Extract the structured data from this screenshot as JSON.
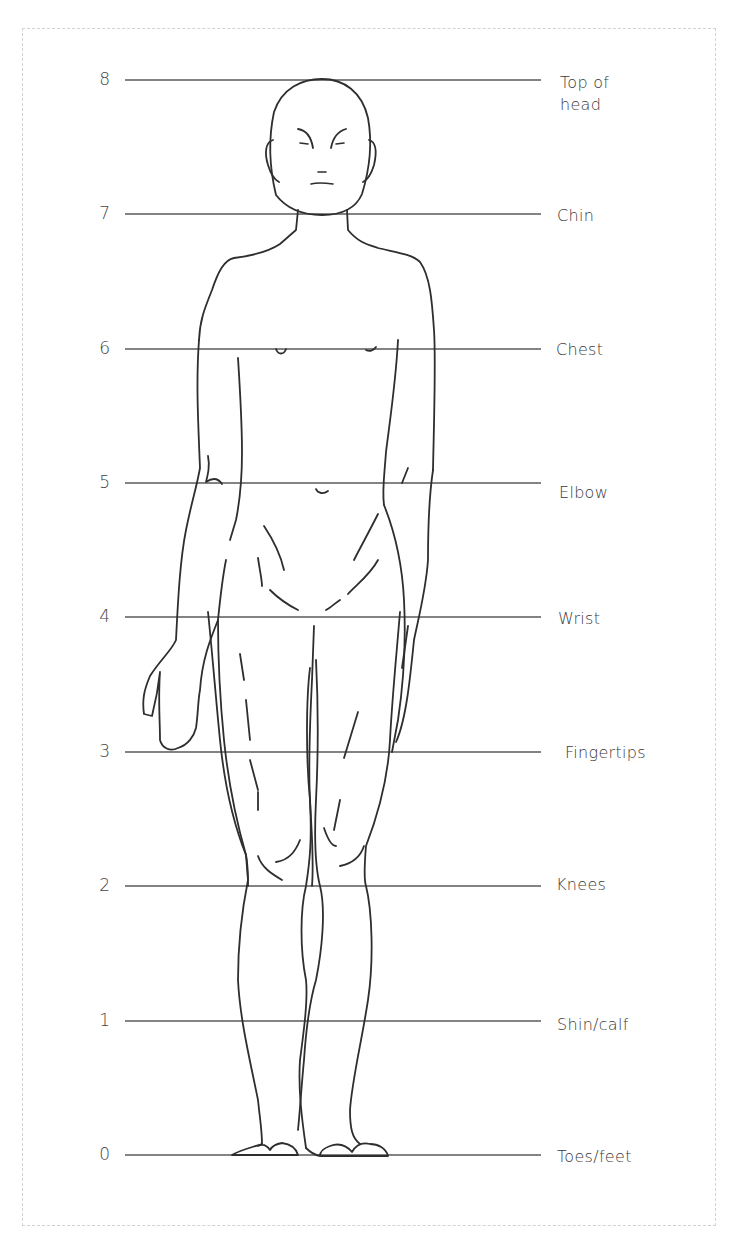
{
  "diagram": {
    "colors": {
      "line": "#555555",
      "text": "#444444",
      "border": "#d2d2d2",
      "background": "#ffffff"
    },
    "levels": [
      {
        "value": "8",
        "label": "Top of\nhead",
        "y": 80
      },
      {
        "value": "7",
        "label": "Chin",
        "y": 214
      },
      {
        "value": "6",
        "label": "Chest",
        "y": 349
      },
      {
        "value": "5",
        "label": "Elbow",
        "y": 483
      },
      {
        "value": "4",
        "label": "Wrist",
        "y": 617
      },
      {
        "value": "3",
        "label": "Fingertips",
        "y": 752
      },
      {
        "value": "2",
        "label": "Knees",
        "y": 886
      },
      {
        "value": "1",
        "label": "Shin/calf",
        "y": 1021
      },
      {
        "value": "0",
        "label": "Toes/feet",
        "y": 1155
      }
    ]
  }
}
